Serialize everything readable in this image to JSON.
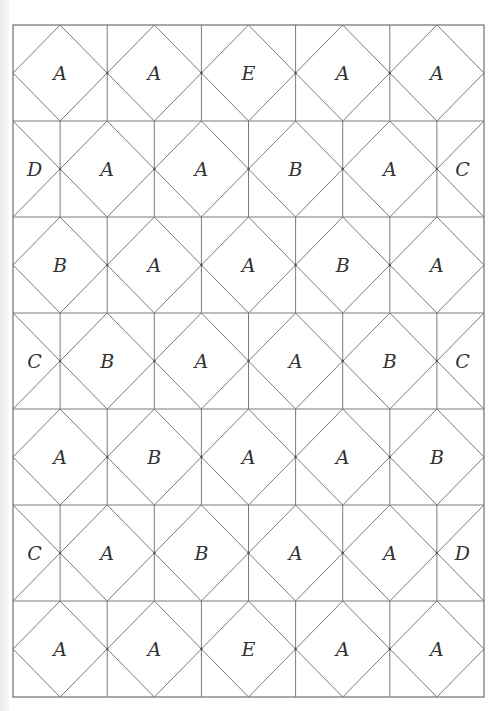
{
  "diagram": {
    "type": "tiling-grid",
    "rows_count": 7,
    "colors": {
      "line": "#7a7a7a",
      "text": "#333333",
      "background": "#ffffff"
    },
    "rows": [
      {
        "kind": "full",
        "cells": [
          "A",
          "A",
          "E",
          "A",
          "A"
        ]
      },
      {
        "kind": "split",
        "left_edge": "D",
        "cells": [
          "A",
          "A",
          "B",
          "A"
        ],
        "right_edge": "C"
      },
      {
        "kind": "full",
        "cells": [
          "B",
          "A",
          "A",
          "B",
          "A"
        ]
      },
      {
        "kind": "split",
        "left_edge": "C",
        "cells": [
          "B",
          "A",
          "A",
          "B"
        ],
        "right_edge": "C"
      },
      {
        "kind": "full",
        "cells": [
          "A",
          "B",
          "A",
          "A",
          "B"
        ]
      },
      {
        "kind": "split",
        "left_edge": "C",
        "cells": [
          "A",
          "B",
          "A",
          "A"
        ],
        "right_edge": "D"
      },
      {
        "kind": "full",
        "cells": [
          "A",
          "A",
          "E",
          "A",
          "A"
        ]
      }
    ]
  }
}
